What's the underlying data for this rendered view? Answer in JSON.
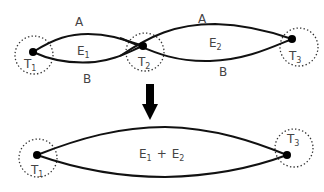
{
  "top_graph": {
    "nodes": [
      {
        "id": "T1",
        "label": "T",
        "subscript": "1"
      },
      {
        "id": "T2",
        "label": "T",
        "subscript": "2"
      },
      {
        "id": "T3",
        "label": "T",
        "subscript": "3"
      }
    ],
    "edges": [
      {
        "from": "T1",
        "to": "T2",
        "upper_label": "A",
        "lower_label": "B",
        "region_label": "E",
        "region_subscript": "1"
      },
      {
        "from": "T2",
        "to": "T3",
        "upper_label": "A",
        "lower_label": "B",
        "region_label": "E",
        "region_subscript": "2"
      }
    ]
  },
  "arrow": {
    "direction": "down",
    "icon": "down-arrow-icon"
  },
  "bottom_graph": {
    "nodes": [
      {
        "id": "T1",
        "label": "T",
        "subscript": "1"
      },
      {
        "id": "T3",
        "label": "T",
        "subscript": "3"
      }
    ],
    "merged_region": {
      "part1": "E",
      "part1_sub": "1",
      "operator": "+",
      "part2": "E",
      "part2_sub": "2"
    }
  },
  "colors": {
    "edge": "#111111",
    "node": "#000000",
    "ring": "#333333",
    "text": "#444444"
  }
}
